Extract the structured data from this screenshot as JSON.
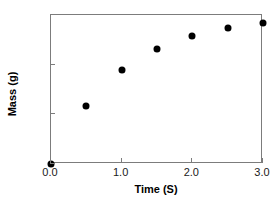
{
  "chart_data": {
    "type": "scatter",
    "title": "",
    "xlabel": "Time (S)",
    "ylabel": "Mass (g)",
    "xlim": [
      0.0,
      3.0
    ],
    "ylim": [
      0.5,
      2.0
    ],
    "xticks": [
      "0.0",
      "1.0",
      "2.0",
      "3.0"
    ],
    "xtick_values": [
      0.0,
      1.0,
      2.0,
      3.0
    ],
    "yticks": [
      "0.5",
      "1.0",
      "1.5",
      "2.0"
    ],
    "ytick_values": [
      0.5,
      1.0,
      1.5,
      2.0
    ],
    "grid": false,
    "legend": null,
    "marker": "filled-circle",
    "marker_color": "#000000",
    "frame_color": "#7c7c7c",
    "x": [
      0.0,
      0.5,
      1.0,
      1.5,
      2.0,
      2.5,
      3.0
    ],
    "values": [
      0.5,
      1.08,
      1.45,
      1.66,
      1.79,
      1.87,
      1.92
    ],
    "points": [
      {
        "x": 0.0,
        "y": 0.5
      },
      {
        "x": 0.5,
        "y": 1.08
      },
      {
        "x": 1.0,
        "y": 1.45
      },
      {
        "x": 1.5,
        "y": 1.66
      },
      {
        "x": 2.0,
        "y": 1.79
      },
      {
        "x": 2.5,
        "y": 1.87
      },
      {
        "x": 3.0,
        "y": 1.92
      }
    ]
  }
}
